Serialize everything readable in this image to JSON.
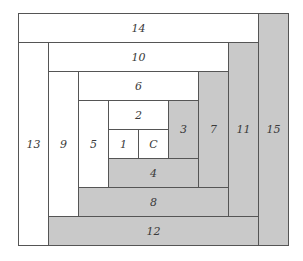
{
  "diagram": {
    "title": "",
    "grid": {
      "origin_x": 18,
      "origin_y": 13,
      "cell_w": 30,
      "cell_h": 29,
      "cols": 9,
      "rows": 8
    },
    "colors": {
      "light": "#ffffff",
      "dark": "#c9c9c9",
      "border": "#555555",
      "text": "#3a3a3a"
    },
    "blocks": [
      {
        "label": "14",
        "shade": "white",
        "x": 0,
        "y": 0,
        "w": 8,
        "h": 1
      },
      {
        "label": "15",
        "shade": "gray",
        "x": 8,
        "y": 0,
        "w": 1,
        "h": 8
      },
      {
        "label": "13",
        "shade": "white",
        "x": 0,
        "y": 1,
        "w": 1,
        "h": 7
      },
      {
        "label": "10",
        "shade": "white",
        "x": 1,
        "y": 1,
        "w": 6,
        "h": 1
      },
      {
        "label": "11",
        "shade": "gray",
        "x": 7,
        "y": 1,
        "w": 1,
        "h": 6
      },
      {
        "label": "12",
        "shade": "gray",
        "x": 1,
        "y": 7,
        "w": 7,
        "h": 1
      },
      {
        "label": "9",
        "shade": "white",
        "x": 1,
        "y": 2,
        "w": 1,
        "h": 5
      },
      {
        "label": "6",
        "shade": "white",
        "x": 2,
        "y": 2,
        "w": 4,
        "h": 1
      },
      {
        "label": "7",
        "shade": "gray",
        "x": 6,
        "y": 2,
        "w": 1,
        "h": 4
      },
      {
        "label": "8",
        "shade": "gray",
        "x": 2,
        "y": 6,
        "w": 5,
        "h": 1
      },
      {
        "label": "5",
        "shade": "white",
        "x": 2,
        "y": 3,
        "w": 1,
        "h": 3
      },
      {
        "label": "2",
        "shade": "white",
        "x": 3,
        "y": 3,
        "w": 2,
        "h": 1
      },
      {
        "label": "3",
        "shade": "gray",
        "x": 5,
        "y": 3,
        "w": 1,
        "h": 2
      },
      {
        "label": "4",
        "shade": "gray",
        "x": 3,
        "y": 5,
        "w": 3,
        "h": 1
      },
      {
        "label": "1",
        "shade": "white",
        "x": 3,
        "y": 4,
        "w": 1,
        "h": 1
      },
      {
        "label": "C",
        "shade": "white",
        "x": 4,
        "y": 4,
        "w": 1,
        "h": 1
      }
    ]
  }
}
